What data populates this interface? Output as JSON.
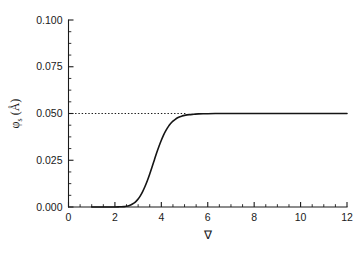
{
  "chart_data": {
    "type": "line",
    "title": "",
    "xlabel": "∇",
    "ylabel_main": "φ",
    "ylabel_sub": "s",
    "ylabel_unit": " (Å)",
    "ylabel_full": "φs (Å)",
    "xlim": [
      0,
      12
    ],
    "ylim": [
      0.0,
      0.1
    ],
    "x_ticks": [
      0,
      2,
      4,
      6,
      8,
      10,
      12
    ],
    "x_tick_labels": [
      "0",
      "2",
      "4",
      "6",
      "8",
      "10",
      "12"
    ],
    "x_minor_step": 0.5,
    "y_ticks": [
      0.0,
      0.025,
      0.05,
      0.075,
      0.1
    ],
    "y_tick_labels": [
      "0.000",
      "0.025",
      "0.050",
      "0.075",
      "0.100"
    ],
    "y_minor_step": 0.00625,
    "grid": false,
    "legend": null,
    "spines": [
      "left",
      "bottom"
    ],
    "tick_direction": "in",
    "annotations": [
      {
        "name": "saturation-asymptote",
        "type": "hline",
        "y": 0.05,
        "x_start": 0.0,
        "x_end": 5.1,
        "style": "dotted"
      }
    ],
    "series": [
      {
        "name": "phi_s",
        "style": "solid",
        "color": "#151515",
        "x": [
          1.0,
          1.25,
          1.5,
          1.75,
          2.0,
          2.2,
          2.4,
          2.5,
          2.6,
          2.7,
          2.8,
          2.9,
          3.0,
          3.1,
          3.2,
          3.3,
          3.4,
          3.5,
          3.6,
          3.7,
          3.8,
          3.9,
          4.0,
          4.1,
          4.2,
          4.3,
          4.4,
          4.5,
          4.6,
          4.7,
          4.8,
          4.9,
          5.0,
          5.2,
          5.4,
          5.6,
          5.8,
          6.0,
          6.5,
          7.0,
          7.5,
          8.0,
          8.5,
          9.0,
          9.5,
          10.0,
          10.5,
          11.0,
          11.5,
          12.0
        ],
        "y": [
          0.0,
          0.0,
          0.0,
          0.0,
          0.0,
          0.0001,
          0.0002,
          0.0004,
          0.0007,
          0.0012,
          0.0019,
          0.0029,
          0.0043,
          0.0061,
          0.0084,
          0.0111,
          0.0142,
          0.0177,
          0.0214,
          0.0252,
          0.029,
          0.0325,
          0.0357,
          0.0386,
          0.041,
          0.043,
          0.0446,
          0.0459,
          0.0469,
          0.0477,
          0.0483,
          0.0487,
          0.049,
          0.0494,
          0.0496,
          0.0498,
          0.0499,
          0.0499,
          0.05,
          0.05,
          0.05,
          0.05,
          0.05,
          0.05,
          0.05,
          0.05,
          0.05,
          0.05,
          0.05,
          0.05
        ]
      }
    ]
  },
  "colors": {
    "ink": "#1a1a1a",
    "curve": "#151515",
    "background": "#ffffff"
  }
}
